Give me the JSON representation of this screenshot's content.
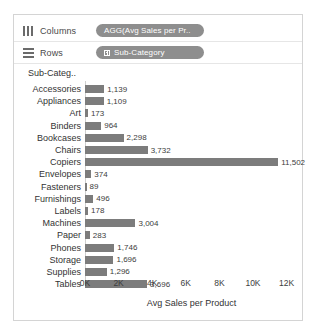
{
  "shelves": [
    {
      "name": "columns",
      "icon": "columns-icon",
      "label": "Columns",
      "pill": "AGG(Avg Sales per Pr..",
      "has_expand": false
    },
    {
      "name": "rows",
      "icon": "rows-icon",
      "label": "Rows",
      "pill": "Sub-Category",
      "has_expand": true
    }
  ],
  "axis_header": "Sub-Categ..",
  "chart_data": {
    "type": "bar",
    "orientation": "horizontal",
    "title": "",
    "xlabel": "Avg Sales per Product",
    "ylabel": "Sub-Categ..",
    "xlim": [
      0,
      12800
    ],
    "xticks": [
      0,
      2000,
      4000,
      6000,
      8000,
      10000,
      12000
    ],
    "xticklabels": [
      "0K",
      "2K",
      "4K",
      "6K",
      "8K",
      "10K",
      "12K"
    ],
    "grid": false,
    "legend": false,
    "bar_color": "#7c7c7c",
    "categories": [
      "Accessories",
      "Appliances",
      "Art",
      "Binders",
      "Bookcases",
      "Chairs",
      "Copiers",
      "Envelopes",
      "Fasteners",
      "Furnishings",
      "Labels",
      "Machines",
      "Paper",
      "Phones",
      "Storage",
      "Supplies",
      "Tables"
    ],
    "values": [
      1139,
      1109,
      173,
      964,
      2298,
      3732,
      11502,
      374,
      89,
      496,
      178,
      3004,
      283,
      1746,
      1696,
      1296,
      3696
    ],
    "value_labels": [
      "1,139",
      "1,109",
      "173",
      "964",
      "2,298",
      "3,732",
      "11,502",
      "374",
      "89",
      "496",
      "178",
      "3,004",
      "283",
      "1,746",
      "1,696",
      "1,296",
      "3,696"
    ]
  }
}
